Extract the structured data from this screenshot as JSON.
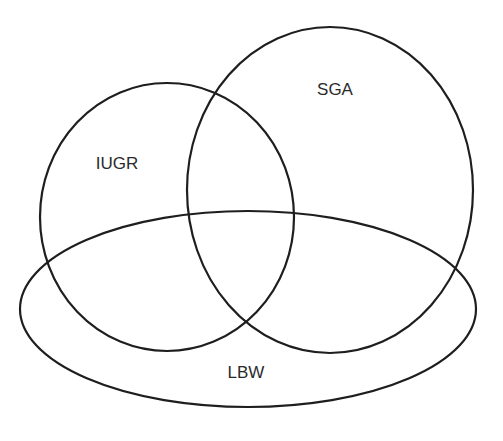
{
  "diagram": {
    "type": "venn",
    "stroke_color": "#1e1e1e",
    "background": "#ffffff",
    "sets": [
      {
        "id": "iugr",
        "label": "IUGR",
        "shape": {
          "cx": 167,
          "cy": 217,
          "rx": 127,
          "ry": 134
        },
        "label_pos": {
          "x": 117,
          "y": 165
        }
      },
      {
        "id": "sga",
        "label": "SGA",
        "shape": {
          "cx": 330,
          "cy": 190,
          "rx": 143,
          "ry": 163
        },
        "label_pos": {
          "x": 335,
          "y": 91
        }
      },
      {
        "id": "lbw",
        "label": "LBW",
        "shape": {
          "cx": 248,
          "cy": 309,
          "rx": 228,
          "ry": 98
        },
        "label_pos": {
          "x": 246,
          "y": 374
        }
      }
    ]
  }
}
